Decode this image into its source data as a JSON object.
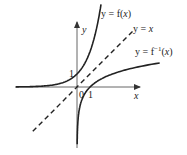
{
  "figure": {
    "curves": [
      {
        "id": "f",
        "label_prefix": "y = f(",
        "label_var": "x",
        "label_suffix": ")",
        "type": "exponential",
        "function": "e^x"
      },
      {
        "id": "identity",
        "label_prefix": "y = ",
        "label_var": "x",
        "label_suffix": "",
        "type": "line",
        "style": "dashed",
        "function": "x"
      },
      {
        "id": "finv",
        "label_prefix": "y = f",
        "label_sup": "−1",
        "label_paren_open": "(",
        "label_var": "x",
        "label_suffix": ")",
        "type": "logarithm",
        "function": "ln(x)"
      }
    ],
    "axes": {
      "x_label": "x",
      "y_label": "y",
      "origin_label": "0",
      "x_tick_label": "1",
      "y_tick_label": "1"
    },
    "colors": {
      "curve": "#222222",
      "axis": "#555555"
    }
  }
}
